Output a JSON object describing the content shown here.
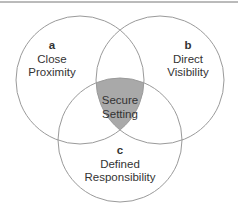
{
  "diagram": {
    "type": "venn",
    "sets": [
      {
        "id": "a",
        "letter": "a",
        "line1": "Close",
        "line2": "Proximity"
      },
      {
        "id": "b",
        "letter": "b",
        "line1": "Direct",
        "line2": "Visibility"
      },
      {
        "id": "c",
        "letter": "c",
        "line1": "Defined",
        "line2": "Responsibility"
      }
    ],
    "intersection": {
      "line1": "Secure",
      "line2": "Setting"
    },
    "colors": {
      "stroke": "#9a9a9a",
      "intersection_fill": "#a9a9a9",
      "text": "#333333",
      "top_rule": "#777777"
    }
  }
}
